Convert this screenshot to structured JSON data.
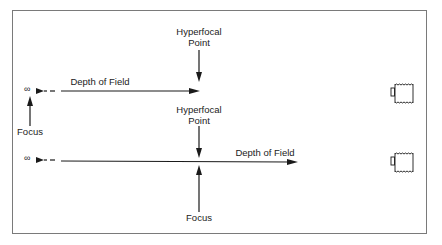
{
  "colors": {
    "line": "#1a1a1a",
    "frame": "#7a7a7a",
    "background": "#ffffff"
  },
  "symbols": {
    "infinity": "∞"
  },
  "top_diagram": {
    "hyperfocal_label_line1": "Hyperfocal",
    "hyperfocal_label_line2": "Point",
    "depth_of_field_label": "Depth of Field",
    "focus_label": "Focus",
    "icon": "camera-icon"
  },
  "bottom_diagram": {
    "hyperfocal_label_line1": "Hyperfocal",
    "hyperfocal_label_line2": "Point",
    "depth_of_field_label": "Depth of Field",
    "focus_label": "Focus",
    "icon": "camera-icon"
  }
}
